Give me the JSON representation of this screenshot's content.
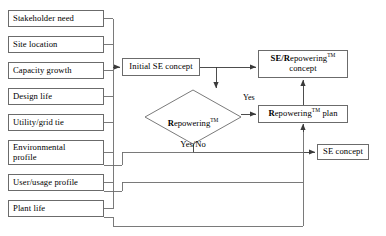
{
  "diagram": {
    "stroke_color": "#6b6b6b",
    "text_color": "#000000",
    "background": "#ffffff",
    "inputs": [
      {
        "id": "stakeholder-need",
        "label": "Stakeholder need",
        "x": 8,
        "y": 10,
        "w": 96,
        "h": 17
      },
      {
        "id": "site-location",
        "label": "Site location",
        "x": 8,
        "y": 36,
        "w": 96,
        "h": 17
      },
      {
        "id": "capacity-growth",
        "label": "Capacity growth",
        "x": 8,
        "y": 62,
        "w": 96,
        "h": 17
      },
      {
        "id": "design-life",
        "label": "Design life",
        "x": 8,
        "y": 88,
        "w": 96,
        "h": 17
      },
      {
        "id": "utility-grid-tie",
        "label": "Utility/grid tie",
        "x": 8,
        "y": 114,
        "w": 96,
        "h": 17
      },
      {
        "id": "environmental-profile",
        "label": "Environmental\nprofile",
        "x": 8,
        "y": 140,
        "w": 96,
        "h": 25
      },
      {
        "id": "user-usage-profile",
        "label": "User/usage profile",
        "x": 8,
        "y": 174,
        "w": 96,
        "h": 17
      },
      {
        "id": "plant-life",
        "label": "Plant life",
        "x": 8,
        "y": 200,
        "w": 96,
        "h": 17
      }
    ],
    "process": {
      "initial_se_concept": {
        "label": "Initial SE concept",
        "x": 122,
        "y": 58,
        "w": 78,
        "h": 18
      },
      "se_repowering_concept": {
        "label_bold": "SE/R",
        "label_rest": "epowering",
        "label_tm": "TM",
        "label_line2": "concept",
        "label_plain": "SE/Repowering™ concept",
        "x": 258,
        "y": 50,
        "w": 90,
        "h": 28
      },
      "repowering_plan": {
        "label_bold": "R",
        "label_rest": "epowering",
        "label_tm": "TM",
        "label_suffix": " plan",
        "label_plain": "Repowering™ plan",
        "x": 258,
        "y": 105,
        "w": 90,
        "h": 18
      },
      "se_concept": {
        "label": "SE concept",
        "x": 317,
        "y": 144,
        "w": 52,
        "h": 16
      }
    },
    "decision": {
      "id": "repowering-decision",
      "label_bold": "R",
      "label_rest": "epowering",
      "label_tm": "TM",
      "label_line2": "Yes/No",
      "label_plain": "Repowering™ Yes/No",
      "cx": 193,
      "cy": 117,
      "rx": 48,
      "ry": 27
    },
    "edge_labels": [
      {
        "id": "yes-label",
        "text": "Yes",
        "x": 243,
        "y": 99
      }
    ]
  }
}
